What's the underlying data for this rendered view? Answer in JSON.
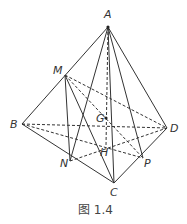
{
  "caption": "图 1.4",
  "points": {
    "A": [
      108,
      27
    ],
    "M": [
      65,
      75
    ],
    "B": [
      22,
      124
    ],
    "D": [
      167,
      128
    ],
    "C": [
      114,
      183
    ],
    "N": [
      70,
      161
    ],
    "P": [
      143,
      158
    ],
    "G": [
      106,
      118
    ],
    "H": [
      106,
      146
    ]
  },
  "labels": {
    "A": "A",
    "M": "M",
    "B": "B",
    "D": "D",
    "C": "C",
    "N": "N",
    "P": "P",
    "G": "G",
    "H": "H"
  },
  "solid_edges": [
    [
      "A",
      "B"
    ],
    [
      "A",
      "D"
    ],
    [
      "A",
      "C"
    ],
    [
      "A",
      "N"
    ],
    [
      "A",
      "P"
    ],
    [
      "B",
      "C"
    ],
    [
      "C",
      "D"
    ],
    [
      "M",
      "N"
    ],
    [
      "M",
      "C"
    ]
  ],
  "dashed_edges": [
    [
      "B",
      "D"
    ],
    [
      "M",
      "D"
    ],
    [
      "M",
      "P"
    ],
    [
      "A",
      "H"
    ],
    [
      "B",
      "P"
    ],
    [
      "N",
      "D"
    ]
  ]
}
